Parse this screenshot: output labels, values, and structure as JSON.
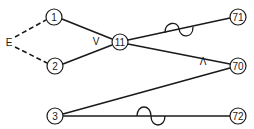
{
  "diagram": {
    "type": "network-graph",
    "colors": {
      "stroke": "#1a1a1a",
      "background": "#ffffff"
    },
    "nodes": [
      {
        "id": "1",
        "label": "1",
        "x": 54,
        "y": 17
      },
      {
        "id": "2",
        "label": "2",
        "x": 55,
        "y": 66
      },
      {
        "id": "11",
        "label": "11",
        "x": 120,
        "y": 42
      },
      {
        "id": "71",
        "label": "71",
        "x": 238,
        "y": 17
      },
      {
        "id": "70",
        "label": "70",
        "x": 238,
        "y": 66
      },
      {
        "id": "3",
        "label": "3",
        "x": 55,
        "y": 116
      },
      {
        "id": "72",
        "label": "72",
        "x": 238,
        "y": 116
      }
    ],
    "labels": {
      "E": "E",
      "or_gate": "V",
      "and_gate": "Λ"
    },
    "edges": [
      {
        "from": "E",
        "to": "1",
        "style": "dashed"
      },
      {
        "from": "E",
        "to": "2",
        "style": "dashed"
      },
      {
        "from": "1",
        "to": "11",
        "style": "solid"
      },
      {
        "from": "2",
        "to": "11",
        "style": "solid"
      },
      {
        "from": "11",
        "to": "71",
        "style": "solid",
        "marker": "sine-wave"
      },
      {
        "from": "11",
        "to": "70",
        "style": "solid"
      },
      {
        "from": "3",
        "to": "70",
        "style": "solid"
      },
      {
        "from": "3",
        "to": "72",
        "style": "solid",
        "marker": "sine-wave"
      }
    ]
  }
}
